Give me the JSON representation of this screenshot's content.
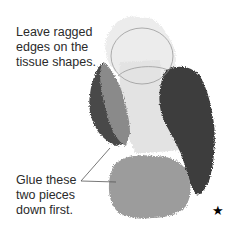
{
  "diagram": {
    "captions": {
      "top": [
        "Leave ragged",
        "edges on the",
        "tissue shapes."
      ],
      "bottom": [
        "Glue these",
        "two pieces",
        "down first."
      ]
    },
    "marker": "★",
    "pieces": [
      {
        "name": "top-light-piece",
        "color": "#ececec"
      },
      {
        "name": "center-light-piece",
        "color": "#e4e4e4"
      },
      {
        "name": "left-dark-piece",
        "color": "#4a4a4a"
      },
      {
        "name": "left-mid-piece",
        "color": "#8a8a8a"
      },
      {
        "name": "right-dark-piece",
        "color": "#3e3e3e"
      },
      {
        "name": "bottom-mid-piece",
        "color": "#9c9c9c"
      }
    ],
    "outline_color": "#9a9a9a",
    "leader_line_color": "#555555"
  }
}
